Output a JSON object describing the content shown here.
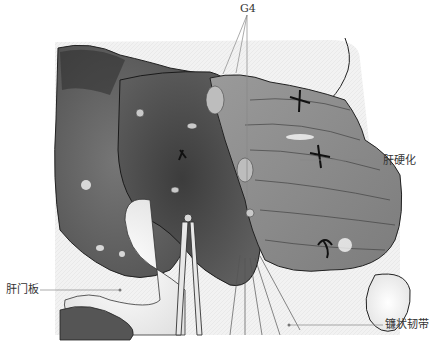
{
  "figure": {
    "type": "surgical-illustration",
    "style": "grayscale",
    "labels": {
      "g4": "G4",
      "cirrhosis": "肝硬化",
      "hilar_plate": "肝门板",
      "falciform_ligament": "镰状韧带"
    },
    "colors": {
      "background": "#ffffff",
      "liver_dark": "#4a4a4a",
      "liver_mid": "#8a8a8a",
      "liver_light": "#b5b5b5",
      "glove": "#f2f2f2",
      "leader_line": "#888888",
      "label_text": "#333333"
    }
  }
}
